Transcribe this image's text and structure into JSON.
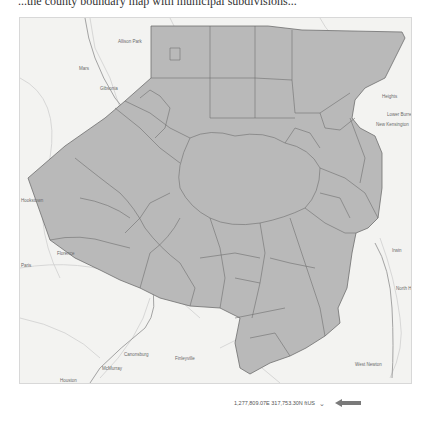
{
  "header": {
    "partial_caption": "...the county boundary map with municipal subdivisions..."
  },
  "map": {
    "basemap_style": "light gray canvas",
    "fill_color": "#b9b9b9",
    "boundary_color": "#6e6e6e",
    "labels": [
      {
        "text": "Allison Park",
        "x": 98,
        "y": 21
      },
      {
        "text": "Mars",
        "x": 59,
        "y": 48
      },
      {
        "text": "Gibsonia",
        "x": 80,
        "y": 68
      },
      {
        "text": "Lower Burrell",
        "x": 367,
        "y": 94
      },
      {
        "text": "New Kensington",
        "x": 356,
        "y": 104
      },
      {
        "text": "Heights",
        "x": 362,
        "y": 76
      },
      {
        "text": "Hookstown",
        "x": 1,
        "y": 180
      },
      {
        "text": "Paris",
        "x": 1,
        "y": 245
      },
      {
        "text": "Florence",
        "x": 37,
        "y": 233
      },
      {
        "text": "Canonsburg",
        "x": 104,
        "y": 334
      },
      {
        "text": "McMurray",
        "x": 82,
        "y": 348
      },
      {
        "text": "Houston",
        "x": 40,
        "y": 360
      },
      {
        "text": "Finleyville",
        "x": 155,
        "y": 338
      },
      {
        "text": "Mingo Creek Park",
        "x": 192,
        "y": 376
      },
      {
        "text": "Irwin",
        "x": 372,
        "y": 230
      },
      {
        "text": "North Huntingdon",
        "x": 376,
        "y": 268
      },
      {
        "text": "West Newton",
        "x": 335,
        "y": 344
      }
    ]
  },
  "status_bar": {
    "coordinates": "1,277,809.07E 317,753.30N ftUS",
    "units_dropdown_icon": "chevron-down-icon",
    "pointer_icon": "arrow-left-icon",
    "pointer_color": "#7a7a7a"
  }
}
